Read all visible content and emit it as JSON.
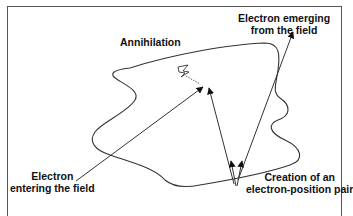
{
  "diagram": {
    "type": "particle-interaction",
    "labels": {
      "annihilation": "Annihilation",
      "emerging_line1": "Electron emerging",
      "emerging_line2": "from the field",
      "entering_line1": "Electron",
      "entering_line2": "entering the field",
      "creation_line1": "Creation of an",
      "creation_line2": "electron-position pair"
    },
    "nodes": [
      {
        "id": "entry",
        "label": "Electron entering the field"
      },
      {
        "id": "annihilation",
        "label": "Annihilation",
        "icon": "lightning-icon"
      },
      {
        "id": "creation",
        "label": "Creation of an electron-position pair"
      },
      {
        "id": "exit",
        "label": "Electron emerging from the field"
      }
    ],
    "edges": [
      {
        "from": "entry",
        "to": "annihilation"
      },
      {
        "from": "creation",
        "to": "annihilation"
      },
      {
        "from": "creation",
        "to": "exit"
      }
    ],
    "colors": {
      "line": "#333333",
      "frame": "#555555",
      "text": "#111111",
      "background": "#ffffff"
    }
  }
}
